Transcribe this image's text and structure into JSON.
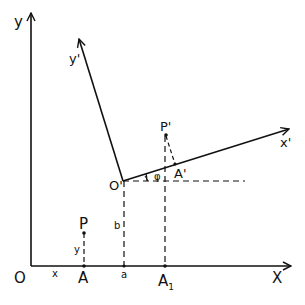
{
  "diagram": {
    "type": "coordinate-rotation-translation",
    "stroke_color": "#111111",
    "background": "#ffffff",
    "axes": {
      "y_label": "y",
      "x_label": "X",
      "origin_label": "O"
    },
    "rotated_axes": {
      "y_label": "y'",
      "x_label": "x'",
      "origin_label": "O'"
    },
    "points": {
      "P": "P",
      "P_prime": "P'",
      "A": "A",
      "A_prime": "A'",
      "A1": "A",
      "A1_sub": "1"
    },
    "segment_labels": {
      "x": "x",
      "y": "y",
      "a": "a",
      "b": "b"
    },
    "angle_label": "φ"
  }
}
